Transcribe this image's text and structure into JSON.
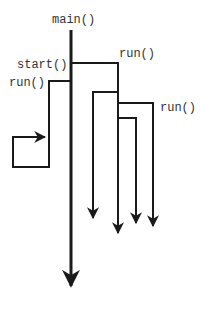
{
  "diagram": {
    "type": "thread-flow",
    "colors": {
      "line": "#1a1a1a",
      "text": "#333333",
      "background": "#ffffff"
    },
    "labels": {
      "main": "main()",
      "start": "start()",
      "run_left": "run()",
      "run_top": "run()",
      "run_right": "run()"
    },
    "nodes": [
      {
        "id": "main-thread",
        "label": "main()"
      },
      {
        "id": "start-call",
        "label": "start()"
      },
      {
        "id": "thread-1",
        "label": "run()"
      },
      {
        "id": "thread-2",
        "label": "run()"
      },
      {
        "id": "thread-3",
        "label": "run()"
      }
    ]
  }
}
